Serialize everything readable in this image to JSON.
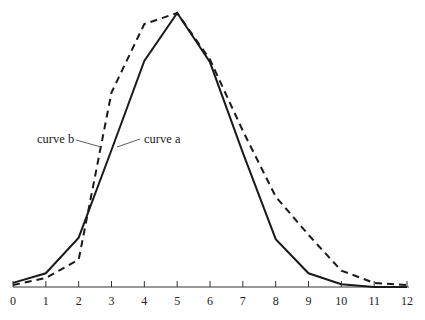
{
  "chart_data": {
    "type": "line",
    "title": "",
    "xlabel": "",
    "ylabel": "",
    "x": [
      0,
      1,
      2,
      3,
      4,
      5,
      6,
      7,
      8,
      9,
      10,
      11,
      12
    ],
    "xlim": [
      0,
      12
    ],
    "ylim": [
      0,
      100
    ],
    "grid": false,
    "y_axis_visible": false,
    "series": [
      {
        "name": "curve a",
        "style": "solid",
        "color": "#1a1a1a",
        "values": [
          1.5,
          5,
          18,
          50,
          82.5,
          100,
          82,
          49,
          17.5,
          5,
          1,
          0,
          0
        ]
      },
      {
        "name": "curve b",
        "style": "dashed",
        "color": "#1a1a1a",
        "values": [
          0.7,
          3.3,
          10,
          71,
          96,
          100,
          83,
          57,
          33,
          19,
          6,
          1.5,
          0.7
        ]
      }
    ],
    "annotations": [
      {
        "text": "curve b",
        "points_to": "curve b",
        "near_x": 2.7
      },
      {
        "text": "curve a",
        "points_to": "curve a",
        "near_x": 3.1
      }
    ],
    "tick_labels": [
      "0",
      "1",
      "2",
      "3",
      "4",
      "5",
      "6",
      "7",
      "8",
      "9",
      "10",
      "11",
      "12"
    ]
  }
}
